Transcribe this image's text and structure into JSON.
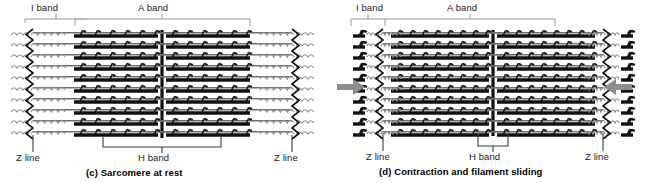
{
  "figure": {
    "background": "#ffffff",
    "ink": "#111111",
    "bracket_light": "#9a9a9a",
    "bracket_dark": "#3a3a3a",
    "arrow_color": "#8d8d8d"
  },
  "panels": [
    {
      "id": "c",
      "caption": "(c) Sarcomere at rest",
      "top_labels": [
        {
          "name": "i-band",
          "text": "I band"
        },
        {
          "name": "a-band",
          "text": "A band"
        }
      ],
      "bottom_labels": [
        {
          "name": "z-line-left",
          "text": "Z line"
        },
        {
          "name": "h-band",
          "text": "H band"
        },
        {
          "name": "z-line-right",
          "text": "Z line"
        }
      ],
      "state": "relaxed",
      "h_band_width_px": 118,
      "i_band_width_px": 62,
      "arrows": []
    },
    {
      "id": "d",
      "caption": "(d) Contraction and filament sliding",
      "top_labels": [
        {
          "name": "i-band",
          "text": "I band"
        },
        {
          "name": "a-band",
          "text": "A band"
        }
      ],
      "bottom_labels": [
        {
          "name": "z-line-left",
          "text": "Z line"
        },
        {
          "name": "h-band",
          "text": "H band"
        },
        {
          "name": "z-line-right",
          "text": "Z line"
        }
      ],
      "state": "contracted",
      "h_band_width_px": 30,
      "i_band_width_px": 34,
      "arrows": [
        {
          "name": "contraction-arrow-left",
          "direction": "right"
        },
        {
          "name": "contraction-arrow-right",
          "direction": "left"
        }
      ]
    }
  ],
  "structures": {
    "z_line": "zigzag vertical Z line",
    "m_line": "thick vertical M line at sarcomere centre",
    "thick_filament": "myosin thick filament with projecting heads",
    "thin_filament": "actin thin filament",
    "titin": "coiled titin spring filament"
  }
}
